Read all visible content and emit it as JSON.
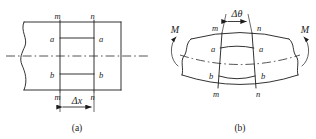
{
  "figure": {
    "background_color": "#ffffff",
    "line_color": "#1c1c1c",
    "width": 316,
    "height": 139
  },
  "panel_a": {
    "caption": "(a)",
    "description": "Undeformed straight beam element",
    "labels": {
      "section_top_left": "m",
      "section_top_right": "n",
      "section_bottom_left": "m",
      "section_bottom_right": "n",
      "fiber_upper_left": "a",
      "fiber_upper_right": "a",
      "fiber_lower_left": "b",
      "fiber_lower_right": "b",
      "dimension": "Δx"
    }
  },
  "panel_b": {
    "caption": "(b)",
    "description": "Deformed beam element under pure bending moments",
    "labels": {
      "moment_left": "M",
      "moment_right": "M",
      "section_top_left": "m",
      "section_top_right": "n",
      "section_bottom_left": "m",
      "section_bottom_right": "n",
      "fiber_upper_left": "a",
      "fiber_upper_right": "a",
      "fiber_lower_left": "b",
      "fiber_lower_right": "b",
      "angle": "Δθ"
    }
  }
}
